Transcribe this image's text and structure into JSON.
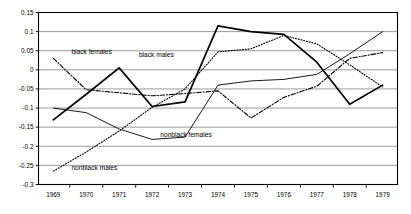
{
  "chart_data": {
    "type": "line",
    "title": "",
    "xlabel": "",
    "ylabel": "",
    "x": [
      1969,
      1970,
      1971,
      1972,
      1973,
      1974,
      1975,
      1976,
      1977,
      1978,
      1979
    ],
    "categories": [
      "1969",
      "1970",
      "1971",
      "1972",
      "1973",
      "1974",
      "1975",
      "1976",
      "1977",
      "1978",
      "1979"
    ],
    "xlim": [
      1968.55,
      1979.45
    ],
    "ylim": [
      -0.3,
      0.15
    ],
    "yticks": [
      0.15,
      0.1,
      0.05,
      0,
      -0.05,
      -0.1,
      -0.15,
      -0.2,
      -0.25,
      -0.3
    ],
    "ytick_labels": [
      "0.15",
      "0.1",
      "0.05",
      "0",
      "-0.05",
      "-0.1",
      "-0.15",
      "-0.2",
      "-0.25",
      "-0.3"
    ],
    "grid": true,
    "grid_axis": "y",
    "legend": "inline-annotations",
    "series": [
      {
        "name": "black females",
        "style": "dash-dot",
        "label_x": 1969.55,
        "label_y": 0.041,
        "values": [
          0.03,
          -0.052,
          -0.06,
          -0.068,
          -0.062,
          -0.055,
          -0.126,
          -0.072,
          -0.043,
          0.03,
          0.045
        ]
      },
      {
        "name": "black males",
        "style": "solid-thick",
        "label_x": 1971.6,
        "label_y": 0.034,
        "values": [
          -0.131,
          -0.064,
          0.005,
          -0.096,
          -0.084,
          0.115,
          0.1,
          0.093,
          0.02,
          -0.09,
          -0.04
        ]
      },
      {
        "name": "nonblack females",
        "style": "solid-thin",
        "label_x": 1972.25,
        "label_y": -0.177,
        "values": [
          -0.1,
          -0.112,
          -0.155,
          -0.182,
          -0.176,
          -0.04,
          -0.029,
          -0.025,
          -0.012,
          0.042,
          0.1
        ]
      },
      {
        "name": "nonblack males",
        "style": "dotted",
        "label_x": 1969.55,
        "label_y": -0.262,
        "values": [
          -0.265,
          -0.215,
          -0.16,
          -0.098,
          -0.05,
          0.047,
          0.055,
          0.09,
          0.068,
          0.013,
          -0.045
        ]
      }
    ]
  },
  "colors": {
    "line": "#000000",
    "grid": "#808080",
    "axis": "#000000",
    "background": "#ffffff"
  }
}
